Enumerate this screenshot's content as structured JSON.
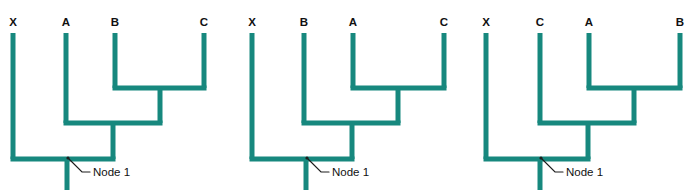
{
  "figure": {
    "background_color": "#ffffff",
    "branch_color": "#17887e",
    "leader_color": "#1d1d1d",
    "text_color": "#111111",
    "branch_width": 5,
    "leader_width": 1.2
  },
  "cladograms": [
    {
      "id": "cladogram-1",
      "origin_x": 0,
      "tips": [
        {
          "label": "X",
          "x": 13,
          "label_x": 13,
          "label_y": 26,
          "top_y": 33
        },
        {
          "label": "A",
          "x": 66,
          "label_x": 66,
          "label_y": 26,
          "top_y": 33
        },
        {
          "label": "B",
          "x": 115,
          "label_x": 115,
          "label_y": 26,
          "top_y": 33
        },
        {
          "label": "C",
          "x": 204,
          "label_x": 204,
          "label_y": 26,
          "top_y": 33
        }
      ],
      "internal_nodes": [
        {
          "name": "B+C",
          "y": 88,
          "left_x": 115,
          "right_x": 204,
          "stem_x": 160
        },
        {
          "name": "A+(B,C)",
          "y": 123,
          "left_x": 66,
          "right_x": 160,
          "stem_x": 113
        },
        {
          "name": "root",
          "y": 159,
          "left_x": 13,
          "right_x": 113,
          "stem_x": 67
        }
      ],
      "root_stem": {
        "x": 67,
        "top_y": 159,
        "bottom_y": 190
      },
      "annotation": {
        "text": "Node 1",
        "point_x": 68,
        "point_y": 158,
        "elbow_x": 82,
        "elbow_y": 172,
        "dash_end_x": 90,
        "text_x": 93,
        "text_y": 176
      }
    },
    {
      "id": "cladogram-2",
      "origin_x": 235,
      "tips": [
        {
          "label": "X",
          "x": 252,
          "label_x": 252,
          "label_y": 26,
          "top_y": 33
        },
        {
          "label": "B",
          "x": 304,
          "label_x": 304,
          "label_y": 26,
          "top_y": 33
        },
        {
          "label": "A",
          "x": 353,
          "label_x": 353,
          "label_y": 26,
          "top_y": 33
        },
        {
          "label": "C",
          "x": 444,
          "label_x": 444,
          "label_y": 26,
          "top_y": 33
        }
      ],
      "internal_nodes": [
        {
          "name": "A+C",
          "y": 88,
          "left_x": 353,
          "right_x": 444,
          "stem_x": 398
        },
        {
          "name": "B+(A,C)",
          "y": 123,
          "left_x": 304,
          "right_x": 398,
          "stem_x": 352
        },
        {
          "name": "root",
          "y": 159,
          "left_x": 252,
          "right_x": 352,
          "stem_x": 306
        }
      ],
      "root_stem": {
        "x": 306,
        "top_y": 159,
        "bottom_y": 190
      },
      "annotation": {
        "text": "Node 1",
        "point_x": 307,
        "point_y": 158,
        "elbow_x": 321,
        "elbow_y": 172,
        "dash_end_x": 329,
        "text_x": 332,
        "text_y": 176
      }
    },
    {
      "id": "cladogram-3",
      "origin_x": 465,
      "tips": [
        {
          "label": "X",
          "x": 486,
          "label_x": 486,
          "label_y": 26,
          "top_y": 33
        },
        {
          "label": "C",
          "x": 540,
          "label_x": 540,
          "label_y": 26,
          "top_y": 33
        },
        {
          "label": "A",
          "x": 589,
          "label_x": 589,
          "label_y": 26,
          "top_y": 33
        },
        {
          "label": "B",
          "x": 680,
          "label_x": 680,
          "label_y": 26,
          "top_y": 33
        }
      ],
      "internal_nodes": [
        {
          "name": "A+B",
          "y": 88,
          "left_x": 589,
          "right_x": 680,
          "stem_x": 634
        },
        {
          "name": "C+(A,B)",
          "y": 123,
          "left_x": 540,
          "right_x": 634,
          "stem_x": 588
        },
        {
          "name": "root",
          "y": 159,
          "left_x": 486,
          "right_x": 588,
          "stem_x": 540
        }
      ],
      "root_stem": {
        "x": 540,
        "top_y": 159,
        "bottom_y": 190
      },
      "annotation": {
        "text": "Node 1",
        "point_x": 541,
        "point_y": 158,
        "elbow_x": 555,
        "elbow_y": 172,
        "dash_end_x": 563,
        "text_x": 566,
        "text_y": 176
      }
    }
  ]
}
